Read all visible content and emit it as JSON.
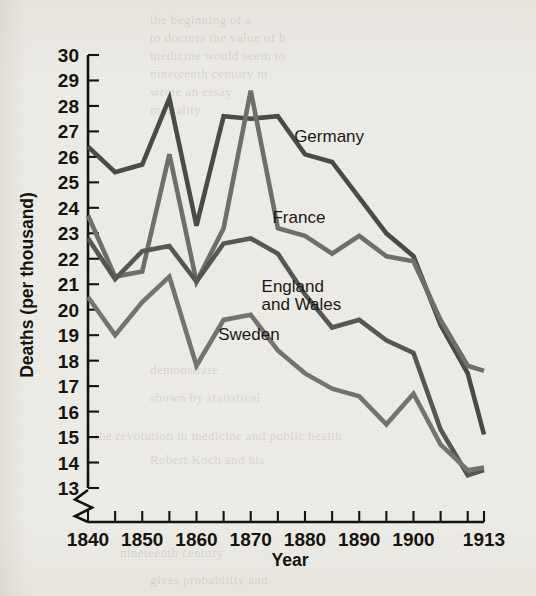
{
  "figure": {
    "background_color": "#edebe5",
    "ink_color": "#16140f"
  },
  "ghost_text": [
    {
      "text": "the beginning of a",
      "x": 150,
      "y": 12
    },
    {
      "text": "to doctors the value of h",
      "x": 150,
      "y": 30
    },
    {
      "text": "medicine would seem to",
      "x": 150,
      "y": 48
    },
    {
      "text": "nineteenth century m",
      "x": 150,
      "y": 66
    },
    {
      "text": "wrote an essay",
      "x": 150,
      "y": 84
    },
    {
      "text": "mortality",
      "x": 150,
      "y": 102
    },
    {
      "text": "demonstrate",
      "x": 150,
      "y": 362
    },
    {
      "text": "shown by statistical",
      "x": 150,
      "y": 390
    },
    {
      "text": "the revolution in medicine and public health",
      "x": 95,
      "y": 428
    },
    {
      "text": "Robert Koch and his",
      "x": 150,
      "y": 452
    },
    {
      "text": "nineteenth century",
      "x": 120,
      "y": 545
    },
    {
      "text": "gives probability and",
      "x": 150,
      "y": 572
    }
  ],
  "chart_data": {
    "type": "line",
    "title": "",
    "xlabel": "Year",
    "ylabel": "Deaths (per thousand)",
    "xlim": [
      1840,
      1913
    ],
    "ylim": [
      13,
      30
    ],
    "grid": false,
    "legend_position": "inline-labels",
    "x_tick_labels": [
      "1840",
      "1850",
      "1860",
      "1870",
      "1880",
      "1890",
      "1900",
      "1913"
    ],
    "x_tick_values": [
      1840,
      1850,
      1860,
      1870,
      1880,
      1890,
      1900,
      1913
    ],
    "x_minor_ticks": [
      1845,
      1855,
      1865,
      1875,
      1885,
      1895,
      1905,
      1910
    ],
    "y_tick_labels": [
      "13",
      "14",
      "15",
      "16",
      "17",
      "18",
      "19",
      "20",
      "21",
      "22",
      "23",
      "24",
      "25",
      "26",
      "27",
      "28",
      "29",
      "30"
    ],
    "y_tick_values": [
      13,
      14,
      15,
      16,
      17,
      18,
      19,
      20,
      21,
      22,
      23,
      24,
      25,
      26,
      27,
      28,
      29,
      30
    ],
    "axis_break_note": "y-axis broken below 13",
    "series": [
      {
        "name": "Germany",
        "color": "#4a4a4a",
        "label_x": 1878,
        "label_y": 26.6,
        "x": [
          1840,
          1845,
          1850,
          1855,
          1860,
          1865,
          1870,
          1875,
          1880,
          1885,
          1890,
          1895,
          1900,
          1905,
          1910,
          1913
        ],
        "values": [
          26.4,
          25.4,
          25.7,
          28.3,
          23.3,
          27.6,
          27.5,
          27.6,
          26.1,
          25.8,
          24.4,
          23.0,
          22.1,
          19.4,
          17.5,
          15.1
        ]
      },
      {
        "name": "France",
        "color": "#6e6e6e",
        "label_x": 1874,
        "label_y": 23.4,
        "x": [
          1840,
          1845,
          1850,
          1855,
          1860,
          1865,
          1870,
          1875,
          1880,
          1885,
          1890,
          1895,
          1900,
          1905,
          1910,
          1913
        ],
        "values": [
          23.7,
          21.3,
          21.5,
          26.1,
          21.1,
          23.2,
          28.6,
          23.2,
          22.9,
          22.2,
          22.9,
          22.1,
          21.9,
          19.6,
          17.8,
          17.6
        ]
      },
      {
        "name": "England and Wales",
        "color": "#565656",
        "label_x": 1872,
        "label_y": 20.7,
        "x": [
          1840,
          1845,
          1850,
          1855,
          1860,
          1865,
          1870,
          1875,
          1880,
          1885,
          1890,
          1895,
          1900,
          1905,
          1910,
          1913
        ],
        "values": [
          22.8,
          21.2,
          22.3,
          22.5,
          21.1,
          22.6,
          22.8,
          22.2,
          20.6,
          19.3,
          19.6,
          18.8,
          18.3,
          15.3,
          13.5,
          13.7
        ]
      },
      {
        "name": "Sweden",
        "color": "#737373",
        "label_x": 1864,
        "label_y": 18.8,
        "x": [
          1840,
          1845,
          1850,
          1855,
          1860,
          1865,
          1870,
          1875,
          1880,
          1885,
          1890,
          1895,
          1900,
          1905,
          1910,
          1913
        ],
        "values": [
          20.5,
          19.0,
          20.3,
          21.3,
          17.8,
          19.6,
          19.8,
          18.4,
          17.5,
          16.9,
          16.6,
          15.5,
          16.7,
          14.7,
          13.7,
          13.8
        ]
      }
    ]
  }
}
